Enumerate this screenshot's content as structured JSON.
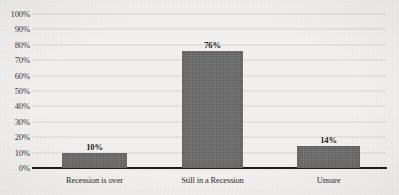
{
  "chart_data": {
    "type": "bar",
    "title": "",
    "subtitle": "",
    "xlabel": "",
    "ylabel": "",
    "categories": [
      "Recession is over",
      "Still in a Recession",
      "Unsure"
    ],
    "values": [
      10,
      76,
      14
    ],
    "value_labels": [
      "10%",
      "76%",
      "14%"
    ],
    "ylim": [
      0,
      100
    ],
    "ytick_values": [
      0,
      10,
      20,
      30,
      40,
      50,
      60,
      70,
      80,
      90,
      100
    ],
    "ytick_labels": [
      "0%",
      "10%",
      "20%",
      "30%",
      "40%",
      "50%",
      "60%",
      "70%",
      "80%",
      "90%",
      "100%"
    ],
    "grid": true,
    "grid_orientation": "horizontal",
    "legend": false,
    "legend_position": "none",
    "series": [
      {
        "name": "Share of respondents",
        "values": [
          10,
          76,
          14
        ]
      }
    ],
    "colors": {
      "bar_fill": "#6e6e6e",
      "gridline": "#d8d8d6",
      "axis_line": "#1d1d1d",
      "background": "#f2f1ef",
      "tick_text": "#3b3b3b",
      "value_label_text": "#232323",
      "category_label_text": "#2e2e2e"
    }
  }
}
